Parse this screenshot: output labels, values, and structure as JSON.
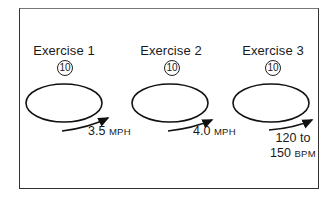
{
  "exercises": [
    {
      "title": "Exercise 1",
      "reps": "10",
      "value": "3.5",
      "unit": "MPH"
    },
    {
      "title": "Exercise 2",
      "reps": "10",
      "value": "4.0",
      "unit": "MPH"
    },
    {
      "title": "Exercise 3",
      "reps": "10",
      "value_line1": "120 to",
      "value_line2": "150",
      "unit": "BPM"
    }
  ]
}
